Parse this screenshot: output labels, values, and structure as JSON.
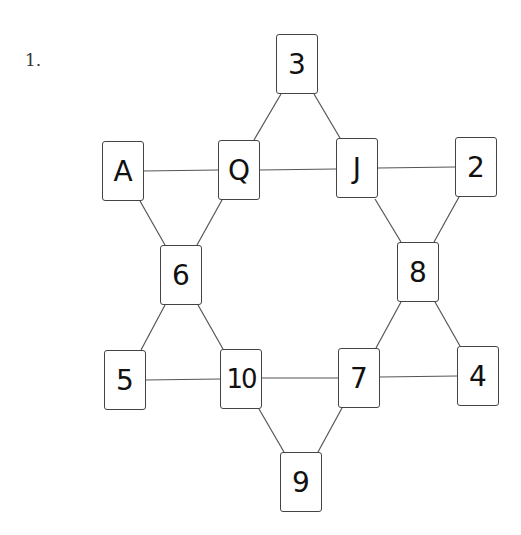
{
  "problem_number": "1.",
  "cards": [
    {
      "id": "c3",
      "label": "3",
      "x": 276,
      "y": 34
    },
    {
      "id": "cA",
      "label": "A",
      "x": 102,
      "y": 141
    },
    {
      "id": "cQ",
      "label": "Q",
      "x": 218,
      "y": 140
    },
    {
      "id": "cJ",
      "label": "J",
      "x": 336,
      "y": 138
    },
    {
      "id": "c2",
      "label": "2",
      "x": 455,
      "y": 137
    },
    {
      "id": "c6",
      "label": "6",
      "x": 160,
      "y": 245
    },
    {
      "id": "c8",
      "label": "8",
      "x": 397,
      "y": 242
    },
    {
      "id": "c5",
      "label": "5",
      "x": 104,
      "y": 350
    },
    {
      "id": "c10",
      "label": "10",
      "x": 220,
      "y": 349
    },
    {
      "id": "c7",
      "label": "7",
      "x": 338,
      "y": 348
    },
    {
      "id": "c4",
      "label": "4",
      "x": 457,
      "y": 346
    },
    {
      "id": "c9",
      "label": "9",
      "x": 280,
      "y": 452
    }
  ],
  "edges": [
    [
      "3",
      "Q"
    ],
    [
      "3",
      "J"
    ],
    [
      "A",
      "Q"
    ],
    [
      "Q",
      "J"
    ],
    [
      "J",
      "2"
    ],
    [
      "A",
      "6"
    ],
    [
      "Q",
      "6"
    ],
    [
      "J",
      "8"
    ],
    [
      "2",
      "8"
    ],
    [
      "6",
      "5"
    ],
    [
      "6",
      "10"
    ],
    [
      "8",
      "7"
    ],
    [
      "8",
      "4"
    ],
    [
      "5",
      "10"
    ],
    [
      "10",
      "7"
    ],
    [
      "7",
      "4"
    ],
    [
      "10",
      "9"
    ],
    [
      "7",
      "9"
    ]
  ]
}
